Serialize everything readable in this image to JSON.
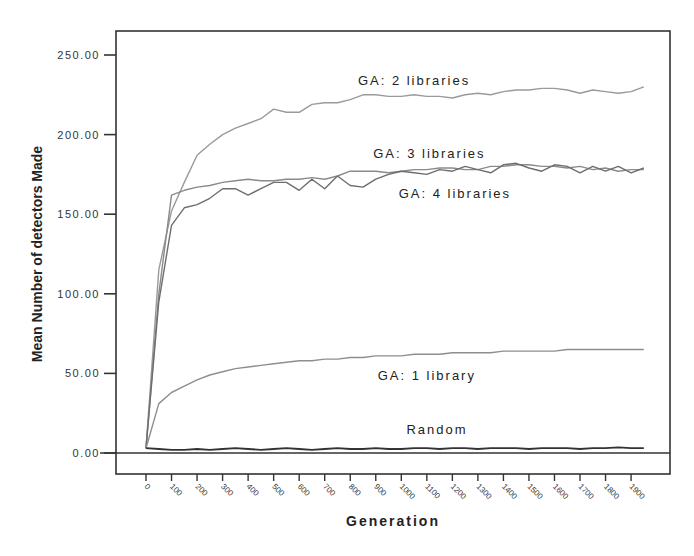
{
  "chart_data": {
    "type": "line",
    "title": "",
    "xlabel": "Generation",
    "ylabel": "Mean Number of detectors Made",
    "xlim": [
      0,
      1950
    ],
    "ylim": [
      -13,
      262
    ],
    "grid": false,
    "legend": "inline labels",
    "x_ticks": [
      0,
      100,
      200,
      300,
      400,
      500,
      600,
      700,
      800,
      900,
      1000,
      1100,
      1200,
      1300,
      1400,
      1500,
      1600,
      1700,
      1800,
      1900
    ],
    "y_ticks": [
      "0.00",
      "50.00",
      "100.00",
      "150.00",
      "200.00",
      "250.00"
    ],
    "x": [
      0,
      50,
      100,
      150,
      200,
      250,
      300,
      350,
      400,
      450,
      500,
      550,
      600,
      650,
      700,
      750,
      800,
      850,
      900,
      950,
      1000,
      1050,
      1100,
      1150,
      1200,
      1250,
      1300,
      1350,
      1400,
      1450,
      1500,
      1550,
      1600,
      1650,
      1700,
      1750,
      1800,
      1850,
      1900,
      1950
    ],
    "series": [
      {
        "name": "GA: 2 libraries",
        "color": "#9a9a9a",
        "values": [
          3,
          115,
          152,
          170,
          187,
          194,
          200,
          204,
          207,
          210,
          216,
          214,
          214,
          219,
          220,
          220,
          222,
          225,
          225,
          224,
          224,
          225,
          224,
          224,
          223,
          225,
          226,
          225,
          227,
          228,
          228,
          229,
          229,
          228,
          226,
          228,
          227,
          226,
          227,
          230
        ]
      },
      {
        "name": "GA: 3 libraries",
        "color": "#8a8a8a",
        "values": [
          3,
          100,
          162,
          165,
          167,
          168,
          170,
          171,
          172,
          171,
          171,
          172,
          172,
          173,
          172,
          174,
          177,
          177,
          177,
          176,
          177,
          178,
          178,
          179,
          179,
          178,
          178,
          180,
          180,
          181,
          181,
          180,
          180,
          179,
          180,
          178,
          179,
          177,
          178,
          178
        ]
      },
      {
        "name": "GA: 4 libraries",
        "color": "#6e6e6e",
        "values": [
          3,
          95,
          143,
          154,
          156,
          160,
          166,
          166,
          162,
          166,
          170,
          170,
          165,
          172,
          166,
          174,
          168,
          167,
          172,
          175,
          177,
          176,
          175,
          178,
          177,
          180,
          178,
          176,
          181,
          182,
          179,
          177,
          181,
          180,
          176,
          180,
          177,
          180,
          176,
          179
        ]
      },
      {
        "name": "GA: 1 library",
        "color": "#8e8e8e",
        "values": [
          3,
          31,
          38,
          42,
          46,
          49,
          51,
          53,
          54,
          55,
          56,
          57,
          58,
          58,
          59,
          59,
          60,
          60,
          61,
          61,
          61,
          62,
          62,
          62,
          63,
          63,
          63,
          63,
          64,
          64,
          64,
          64,
          64,
          65,
          65,
          65,
          65,
          65,
          65,
          65
        ]
      },
      {
        "name": "Random",
        "color": "#333333",
        "values": [
          3,
          2.5,
          2,
          2,
          2.5,
          2,
          2.5,
          3,
          2.5,
          2,
          2.5,
          3,
          2.5,
          2,
          2.5,
          3,
          2.5,
          2.5,
          3,
          2.5,
          2.5,
          3,
          3,
          2.5,
          3,
          3,
          2.5,
          3,
          3,
          3,
          2.5,
          3,
          3,
          3,
          2.5,
          3,
          3,
          3.5,
          3,
          3
        ]
      }
    ],
    "annotations": [
      {
        "text": "GA: 2 libraries",
        "x": 1050,
        "y": 231
      },
      {
        "text": "GA: 3 libraries",
        "x": 1110,
        "y": 185
      },
      {
        "text": "GA: 4 libraries",
        "x": 1210,
        "y": 160
      },
      {
        "text": "GA: 1 library",
        "x": 1100,
        "y": 46
      },
      {
        "text": "Random",
        "x": 1140,
        "y": 12
      }
    ]
  }
}
